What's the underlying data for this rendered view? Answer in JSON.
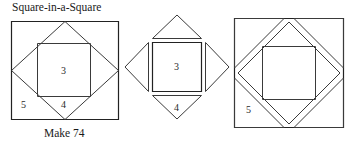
{
  "diagram": {
    "title": "Square-in-a-Square",
    "caption": "Make 74",
    "panels": [
      {
        "name": "assembled-block",
        "pieces": [
          {
            "number": "3",
            "role": "center-square"
          },
          {
            "number": "4",
            "role": "side-triangle"
          },
          {
            "number": "5",
            "role": "corner-triangle"
          }
        ]
      },
      {
        "name": "center-unit-exploded",
        "pieces": [
          {
            "number": "3",
            "role": "center-square"
          },
          {
            "number": "4",
            "role": "side-triangle"
          }
        ]
      },
      {
        "name": "outer-unit-exploded",
        "pieces": [
          {
            "number": "5",
            "role": "corner-triangle"
          }
        ]
      }
    ]
  },
  "labels": {
    "panel1_center": "3",
    "panel1_corner": "5",
    "panel1_side": "4",
    "panel2_center": "3",
    "panel2_side": "4",
    "panel3_corner": "5"
  },
  "colors": {
    "line": "#3a3a3a",
    "line_dark": "#222222",
    "text": "#1a1a1a",
    "background": "#ffffff"
  }
}
